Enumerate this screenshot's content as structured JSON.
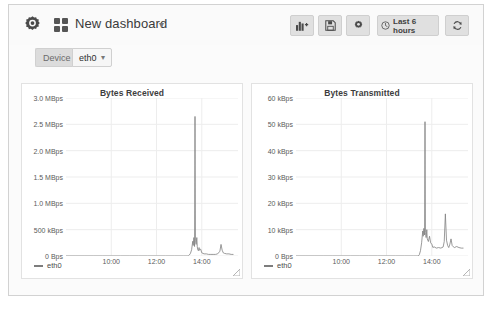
{
  "header": {
    "logo_icon": "grafana-gear-logo",
    "grid_icon": "dashboard-grid-icon",
    "title": "New dashboard",
    "title_caret": "▾",
    "buttons": [
      {
        "name": "add-panel-button",
        "icon": "add-panel-icon",
        "label": ""
      },
      {
        "name": "save-dashboard-button",
        "icon": "save-icon",
        "label": ""
      },
      {
        "name": "dashboard-settings-button",
        "icon": "gear-icon",
        "label": ""
      },
      {
        "name": "time-range-button",
        "icon": "clock-icon",
        "label": "Last 6 hours"
      },
      {
        "name": "refresh-button",
        "icon": "refresh-icon",
        "label": ""
      }
    ]
  },
  "variables": {
    "device": {
      "label": "Device",
      "value": "eth0",
      "caret": "▾"
    }
  },
  "panels": [
    {
      "name": "panel-bytes-received",
      "legend": "eth0",
      "chart_data": {
        "type": "line",
        "title": "Bytes Received",
        "xlabel": "",
        "ylabel": "",
        "grid": true,
        "legend_position": "bottom-left",
        "series": [
          {
            "name": "eth0",
            "color": "#808080",
            "x": [
              8.0,
              8.4,
              8.8,
              9.2,
              9.6,
              10.0,
              10.4,
              10.8,
              11.2,
              11.6,
              12.0,
              12.4,
              12.8,
              13.2,
              13.3,
              13.4,
              13.45,
              13.5,
              13.55,
              13.6,
              13.62,
              13.65,
              13.68,
              13.7,
              13.72,
              13.75,
              13.78,
              13.8,
              13.82,
              13.85,
              13.88,
              13.9,
              13.95,
              14.0,
              14.05,
              14.1,
              14.2,
              14.3,
              14.4,
              14.5,
              14.6,
              14.7,
              14.8,
              14.85,
              14.9,
              14.95,
              15.0,
              15.1,
              15.2,
              15.3,
              15.4
            ],
            "y": [
              0,
              0,
              0,
              0,
              0,
              0,
              0,
              0,
              0,
              0,
              0,
              0,
              0,
              0,
              0,
              0,
              0.02,
              0.05,
              0.12,
              0.28,
              0.2,
              0.35,
              0.18,
              2.65,
              0.3,
              0.22,
              0.35,
              0.18,
              0.12,
              0.1,
              0.16,
              0.11,
              0.13,
              0.06,
              0.05,
              0.04,
              0.04,
              0.03,
              0.03,
              0.03,
              0.03,
              0.04,
              0.09,
              0.22,
              0.11,
              0.06,
              0.05,
              0.04,
              0.04,
              0.03,
              0.03
            ]
          }
        ],
        "xlim": [
          8.0,
          15.6
        ],
        "ylim": [
          0,
          3.0
        ],
        "xticks": [
          10,
          12,
          14
        ],
        "xticklabels": [
          "10:00",
          "12:00",
          "14:00"
        ],
        "yticks": [
          0,
          0.5,
          1.0,
          1.5,
          2.0,
          2.5,
          3.0
        ],
        "yticklabels": [
          "0 Bps",
          "500 kBps",
          "1.0 MBps",
          "1.5 MBps",
          "2.0 MBps",
          "2.5 MBps",
          "3.0 MBps"
        ],
        "yunit": "MBps",
        "peak_value": 2.65
      }
    },
    {
      "name": "panel-bytes-transmitted",
      "legend": "eth0",
      "chart_data": {
        "type": "line",
        "title": "Bytes Transmitted",
        "xlabel": "",
        "ylabel": "",
        "grid": true,
        "legend_position": "bottom-left",
        "series": [
          {
            "name": "eth0",
            "color": "#808080",
            "x": [
              8.0,
              8.4,
              8.8,
              9.2,
              9.6,
              10.0,
              10.4,
              10.8,
              11.2,
              11.6,
              12.0,
              12.4,
              12.8,
              13.2,
              13.3,
              13.4,
              13.45,
              13.5,
              13.55,
              13.6,
              13.62,
              13.65,
              13.68,
              13.7,
              13.72,
              13.75,
              13.78,
              13.8,
              13.85,
              13.9,
              13.95,
              14.0,
              14.05,
              14.1,
              14.2,
              14.3,
              14.4,
              14.5,
              14.55,
              14.6,
              14.65,
              14.7,
              14.75,
              14.8,
              14.85,
              14.9,
              14.95,
              15.0,
              15.1,
              15.2,
              15.3,
              15.4
            ],
            "y": [
              0,
              0,
              0,
              0,
              0,
              0,
              0,
              0,
              0,
              0,
              0,
              0,
              0,
              0,
              0,
              0,
              0.5,
              2,
              5,
              9.5,
              7.5,
              10.5,
              8,
              51,
              9,
              7,
              10,
              6.5,
              5.5,
              7.5,
              5.0,
              4.5,
              3.2,
              3.5,
              3.0,
              3.2,
              3.0,
              3.4,
              5.5,
              16.0,
              6.0,
              4.0,
              3.2,
              4.5,
              6.5,
              4.0,
              3.5,
              3.2,
              3.6,
              3.2,
              3.0,
              3.0
            ]
          }
        ],
        "xlim": [
          8.0,
          15.6
        ],
        "ylim": [
          0,
          60
        ],
        "xticks": [
          10,
          12,
          14
        ],
        "xticklabels": [
          "10:00",
          "12:00",
          "14:00"
        ],
        "yticks": [
          0,
          10,
          20,
          30,
          40,
          50,
          60
        ],
        "yticklabels": [
          "0 Bps",
          "10 kBps",
          "20 kBps",
          "30 kBps",
          "40 kBps",
          "50 kBps",
          "60 kBps"
        ],
        "yunit": "kBps",
        "peak_value": 51
      }
    }
  ],
  "colors": {
    "line": "#808080",
    "panel_bg": "#ffffff",
    "page_bg": "#fbfbfb",
    "grid": "#ededed"
  }
}
